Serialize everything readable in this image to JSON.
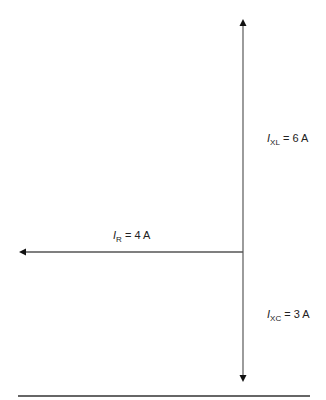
{
  "diagram": {
    "type": "phasor-diagram",
    "vectors": [
      {
        "name": "I_XL",
        "symbol": "I",
        "subscript": "XL",
        "value_text": "= 6 A",
        "direction": "up"
      },
      {
        "name": "I_R",
        "symbol": "I",
        "subscript": "R",
        "value_text": "= 4 A",
        "direction": "left"
      },
      {
        "name": "I_XC",
        "symbol": "I",
        "subscript": "XC",
        "value_text": "= 3 A",
        "direction": "down"
      }
    ],
    "colors": {
      "line": "#555555",
      "text": "#222222",
      "rule": "#333333"
    }
  }
}
